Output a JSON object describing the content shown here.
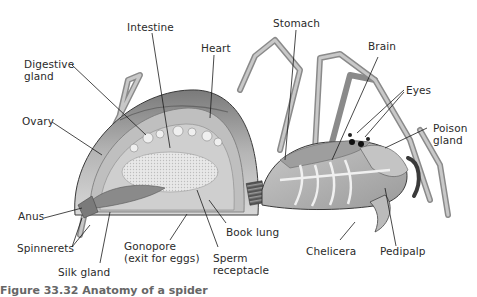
{
  "figure": {
    "palette": {
      "background": "#ffffff",
      "body_light": "#d9d9d9",
      "body_mid": "#a8a8a8",
      "body_dark": "#6a6a6a",
      "outline": "#3a3a3a",
      "label_text": "#2a2a2a",
      "leader_line": "#1a1a1a"
    },
    "labels": {
      "intestine": "Intestine",
      "heart": "Heart",
      "stomach": "Stomach",
      "brain": "Brain",
      "digestive_gland": "Digestive\ngland",
      "eyes": "Eyes",
      "ovary": "Ovary",
      "poison_gland": "Poison\ngland",
      "anus": "Anus",
      "spinnerets": "Spinnerets",
      "silk_gland": "Silk gland",
      "gonopore": "Gonopore\n(exit for eggs)",
      "book_lung": "Book lung",
      "sperm_receptacle": "Sperm\nreceptacle",
      "chelicera": "Chelicera",
      "pedipalp": "Pedipalp"
    },
    "caption": "Figure 33.32 Anatomy of a spider"
  }
}
